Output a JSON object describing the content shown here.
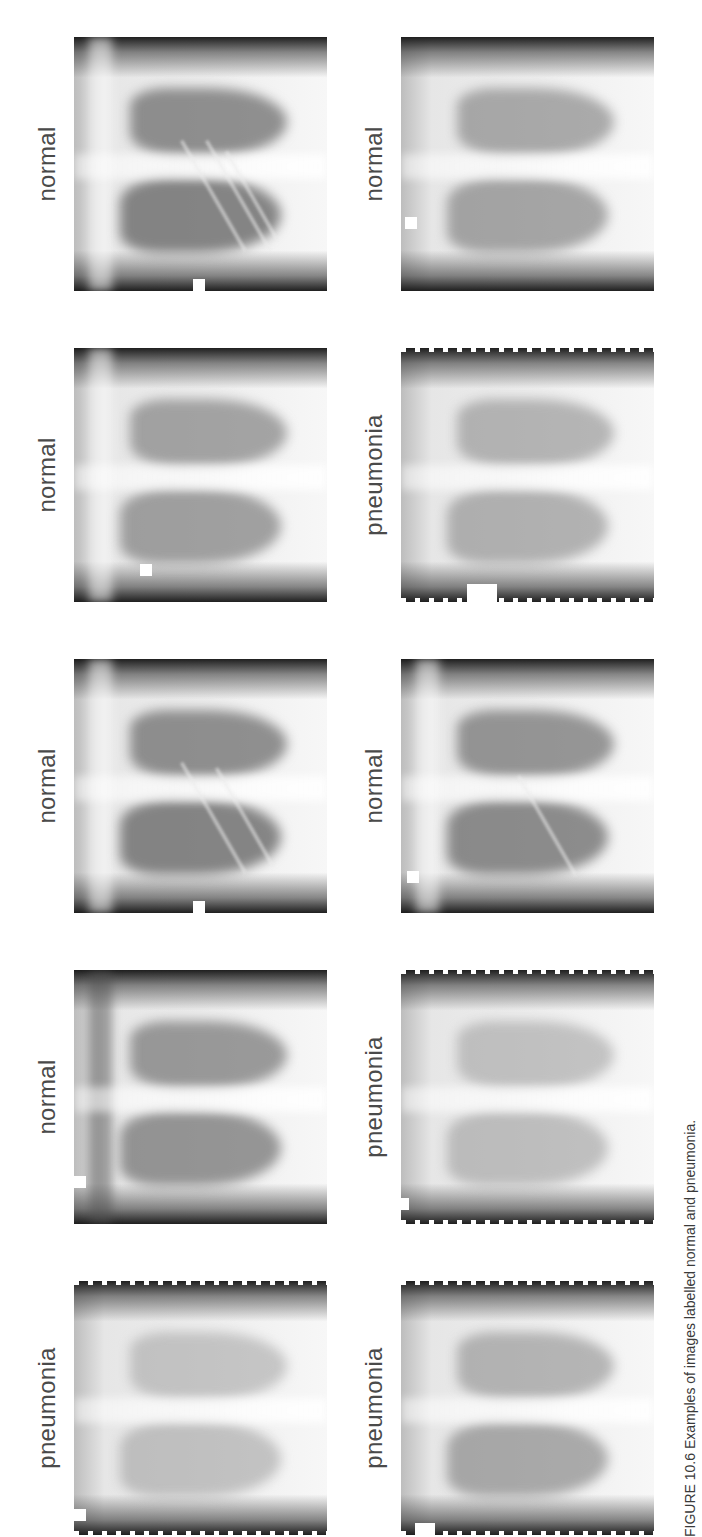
{
  "figure": {
    "orientation": "rotated-90-ccw",
    "caption": "FIGURE 10.6 Examples of images labelled normal and pneumonia.",
    "columns": [
      {
        "cells": [
          {
            "label": "normal",
            "variant": "clear"
          },
          {
            "label": "normal",
            "variant": "soft"
          },
          {
            "label": "normal",
            "variant": "clear"
          },
          {
            "label": "normal",
            "variant": "soft"
          },
          {
            "label": "pneumonia",
            "variant": "hazy"
          }
        ]
      },
      {
        "cells": [
          {
            "label": "normal",
            "variant": "soft"
          },
          {
            "label": "pneumonia",
            "variant": "hazy"
          },
          {
            "label": "normal",
            "variant": "clear"
          },
          {
            "label": "pneumonia",
            "variant": "hazy"
          },
          {
            "label": "pneumonia",
            "variant": "hazy"
          }
        ]
      }
    ]
  },
  "colors": {
    "label_text": "#4a4a4a",
    "background": "#ffffff"
  }
}
